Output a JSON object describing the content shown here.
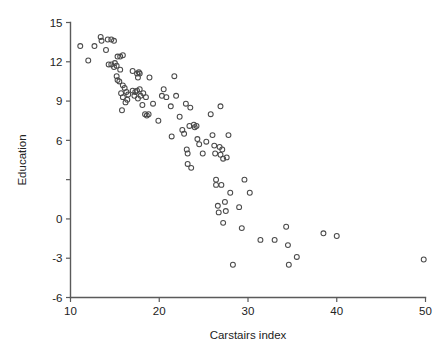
{
  "chart_data": {
    "type": "scatter",
    "title": "",
    "xlabel": "Carstairs index",
    "ylabel": "Education",
    "xlim": [
      10,
      50
    ],
    "ylim": [
      -6,
      15
    ],
    "xticks": [
      10,
      20,
      30,
      40,
      50
    ],
    "xticklabels": [
      "10",
      "20",
      "30",
      "40",
      "50"
    ],
    "yticks": [
      15,
      12,
      9,
      6,
      3,
      0,
      -3,
      -6
    ],
    "yticklabels": [
      "15",
      "12",
      "9",
      "6",
      "",
      "0",
      "-3",
      "-6"
    ],
    "grid": false,
    "legend": null,
    "marker": "open-circle",
    "marker_color": "#4a4a4a",
    "points": [
      [
        11.1,
        13.2
      ],
      [
        12.0,
        12.1
      ],
      [
        12.7,
        13.2
      ],
      [
        13.4,
        13.9
      ],
      [
        13.5,
        13.6
      ],
      [
        14.0,
        12.9
      ],
      [
        14.2,
        13.7
      ],
      [
        14.6,
        13.7
      ],
      [
        14.9,
        13.6
      ],
      [
        14.3,
        11.8
      ],
      [
        14.6,
        11.8
      ],
      [
        14.9,
        11.6
      ],
      [
        15.0,
        11.9
      ],
      [
        15.2,
        11.7
      ],
      [
        15.3,
        12.4
      ],
      [
        15.6,
        12.4
      ],
      [
        15.9,
        12.5
      ],
      [
        15.2,
        10.9
      ],
      [
        15.3,
        10.6
      ],
      [
        15.5,
        10.5
      ],
      [
        15.6,
        11.4
      ],
      [
        15.9,
        10.2
      ],
      [
        16.1,
        10.0
      ],
      [
        15.7,
        9.6
      ],
      [
        15.9,
        9.3
      ],
      [
        16.3,
        9.7
      ],
      [
        16.5,
        9.5
      ],
      [
        16.2,
        8.9
      ],
      [
        16.4,
        9.1
      ],
      [
        15.8,
        8.3
      ],
      [
        17.0,
        11.3
      ],
      [
        17.5,
        11.1
      ],
      [
        17.7,
        11.2
      ],
      [
        17.8,
        11.1
      ],
      [
        17.6,
        10.8
      ],
      [
        17.0,
        9.8
      ],
      [
        17.3,
        9.7
      ],
      [
        17.5,
        9.8
      ],
      [
        17.8,
        9.9
      ],
      [
        17.2,
        9.4
      ],
      [
        17.6,
        9.2
      ],
      [
        17.9,
        9.4
      ],
      [
        18.2,
        9.6
      ],
      [
        18.5,
        9.3
      ],
      [
        18.1,
        8.7
      ],
      [
        18.4,
        8.0
      ],
      [
        18.6,
        7.9
      ],
      [
        18.8,
        8.0
      ],
      [
        18.9,
        10.8
      ],
      [
        19.3,
        8.8
      ],
      [
        19.9,
        7.5
      ],
      [
        20.3,
        9.4
      ],
      [
        20.5,
        9.9
      ],
      [
        20.8,
        9.3
      ],
      [
        21.3,
        8.6
      ],
      [
        21.4,
        6.3
      ],
      [
        21.7,
        10.9
      ],
      [
        21.9,
        9.4
      ],
      [
        22.3,
        7.8
      ],
      [
        22.6,
        6.8
      ],
      [
        22.8,
        6.5
      ],
      [
        23.0,
        8.8
      ],
      [
        23.1,
        5.3
      ],
      [
        23.2,
        5.0
      ],
      [
        23.2,
        4.2
      ],
      [
        23.4,
        7.1
      ],
      [
        23.5,
        8.5
      ],
      [
        23.6,
        3.9
      ],
      [
        23.9,
        7.2
      ],
      [
        24.0,
        7.0
      ],
      [
        24.2,
        7.1
      ],
      [
        24.3,
        6.1
      ],
      [
        24.5,
        5.7
      ],
      [
        24.9,
        5.0
      ],
      [
        25.3,
        5.9
      ],
      [
        25.8,
        8.0
      ],
      [
        26.0,
        6.4
      ],
      [
        26.2,
        5.6
      ],
      [
        26.3,
        5.0
      ],
      [
        26.4,
        3.0
      ],
      [
        26.4,
        2.6
      ],
      [
        26.6,
        1.0
      ],
      [
        26.7,
        0.5
      ],
      [
        26.8,
        5.5
      ],
      [
        26.9,
        4.9
      ],
      [
        26.9,
        8.6
      ],
      [
        27.0,
        2.6
      ],
      [
        27.1,
        5.3
      ],
      [
        27.2,
        4.6
      ],
      [
        27.2,
        -0.3
      ],
      [
        27.4,
        1.3
      ],
      [
        27.5,
        0.6
      ],
      [
        27.6,
        4.7
      ],
      [
        27.8,
        6.4
      ],
      [
        28.0,
        2.0
      ],
      [
        28.3,
        -3.5
      ],
      [
        29.0,
        0.9
      ],
      [
        29.3,
        -0.7
      ],
      [
        29.6,
        3.0
      ],
      [
        30.2,
        2.0
      ],
      [
        31.4,
        -1.6
      ],
      [
        33.0,
        -1.6
      ],
      [
        34.3,
        -0.6
      ],
      [
        34.5,
        -2.0
      ],
      [
        34.6,
        -3.5
      ],
      [
        35.5,
        -2.9
      ],
      [
        38.5,
        -1.1
      ],
      [
        40.0,
        -1.3
      ],
      [
        49.8,
        -3.1
      ]
    ]
  },
  "figure": {
    "background_color": "#ffffff",
    "axis_color": "#5a5a5a",
    "text_color": "#222222"
  }
}
